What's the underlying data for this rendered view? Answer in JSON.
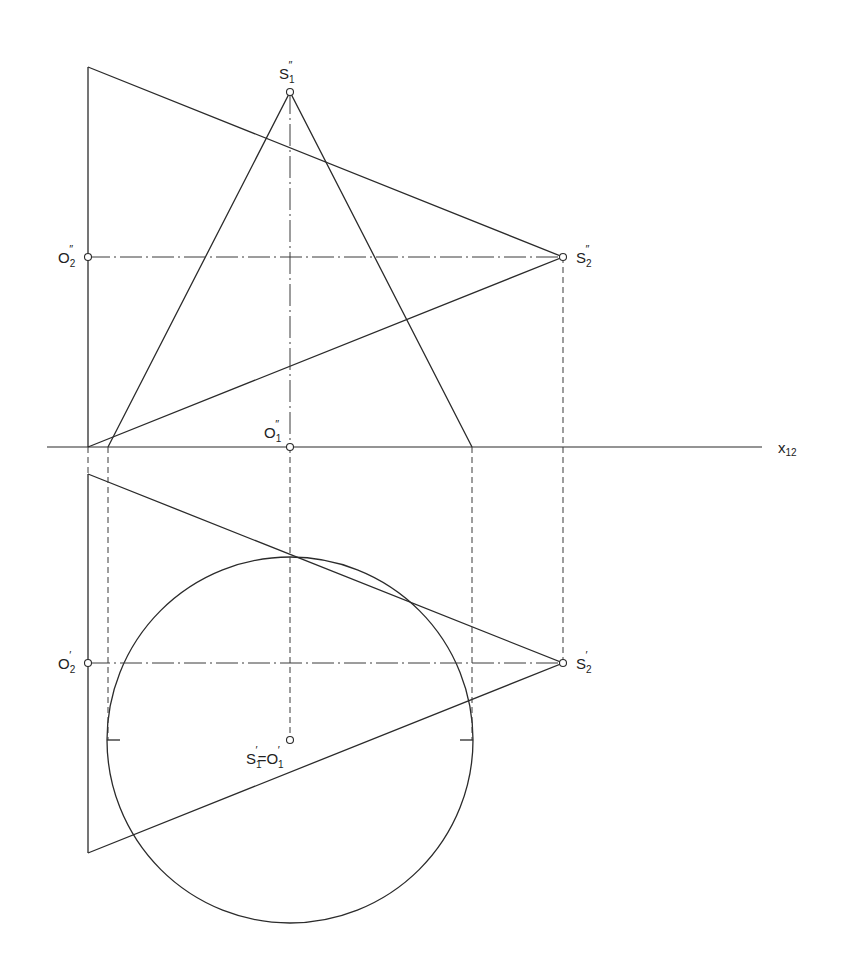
{
  "diagram": {
    "type": "descriptive-geometry-projection",
    "axis": {
      "label_main": "x",
      "label_sub": "12"
    },
    "points": {
      "S1_front": {
        "base": "S",
        "sub": "1",
        "prime": "″"
      },
      "O2_front": {
        "base": "O",
        "sub": "2",
        "prime": "″"
      },
      "S2_front": {
        "base": "S",
        "sub": "2",
        "prime": "″"
      },
      "O1_front": {
        "base": "O",
        "sub": "1",
        "prime": "″"
      },
      "O2_top": {
        "base": "O",
        "sub": "2",
        "prime": "′"
      },
      "S2_top": {
        "base": "S",
        "sub": "2",
        "prime": "′"
      },
      "S1_top": {
        "base": "S",
        "sub": "1",
        "prime": "′"
      },
      "O1_top": {
        "base": "O",
        "sub": "1",
        "prime": "′"
      },
      "equals": "="
    },
    "line_styles": {
      "solid": "#2b2b2b",
      "center": "#3a3a3a",
      "hidden": "#3a3a3a"
    }
  }
}
